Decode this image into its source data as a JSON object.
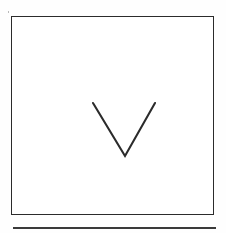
{
  "document": {
    "kind": "scanned-form-figure",
    "background_color": "#ffffff",
    "paper_color": "#fefefe",
    "ink_color": "#2b2b2b",
    "width_px": 226,
    "height_px": 233
  },
  "frame": {
    "label": "",
    "shape": "rectangle",
    "x": 11,
    "y": 16,
    "width": 203,
    "height": 199,
    "stroke_color": "#2b2b2b",
    "stroke_width": 1.6,
    "fill_color": "#ffffff"
  },
  "mark": {
    "name": "checkmark-v-stroke",
    "glyph": "V",
    "shape": "chevron",
    "stroke_color": "#2b2b2b",
    "stroke_width": 2.1,
    "left_top_x": 81,
    "left_top_y": 86,
    "apex_x": 113,
    "apex_y": 139,
    "right_top_x": 143,
    "right_top_y": 86,
    "points": "5,6 37,59 67,6"
  },
  "next_frame_edge": {
    "name": "next-box-top-edge",
    "shape": "line",
    "x": 13,
    "y": 227,
    "width": 203,
    "stroke_color": "#3a3a3a",
    "stroke_width": 1.7
  },
  "artifacts": {
    "speck": {
      "x": 8,
      "y": 11,
      "color": "#b9b9b9"
    }
  }
}
